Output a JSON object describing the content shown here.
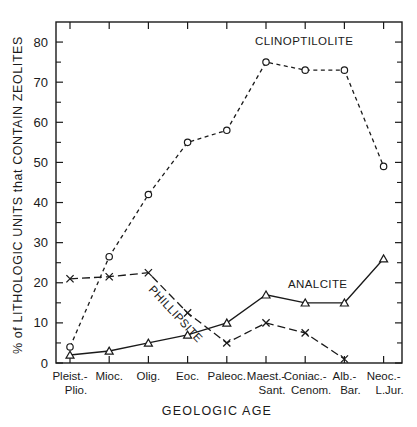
{
  "chart_data": {
    "type": "line",
    "title": "",
    "xlabel": "GEOLOGIC AGE",
    "ylabel": "% of LITHOLOGIC UNITS that CONTAIN ZEOLITES",
    "categories": [
      "Pleist.-\nPlio.",
      "Mioc.",
      "Olig.",
      "Eoc.",
      "Paleoc.",
      "Maest.-\nSant.",
      "Coniac.-\nCenom.",
      "Alb.-\nBar.",
      "Neoc.-\nL.Jur."
    ],
    "category_lines": [
      [
        "Pleist.-",
        "Plio."
      ],
      [
        "Mioc.",
        ""
      ],
      [
        "Olig.",
        ""
      ],
      [
        "Eoc.",
        ""
      ],
      [
        "Paleoc.",
        ""
      ],
      [
        "Maest.-",
        "Sant."
      ],
      [
        "Coniac.-",
        "Cenom."
      ],
      [
        "Alb.-",
        "Bar."
      ],
      [
        "Neoc.-",
        "L.Jur."
      ]
    ],
    "ylim": [
      0,
      85
    ],
    "yticks": [
      0,
      10,
      20,
      30,
      40,
      50,
      60,
      70,
      80
    ],
    "ytick_labels": [
      "0",
      "10",
      "20",
      "30",
      "40",
      "50",
      "60",
      "70",
      "80"
    ],
    "yminor_step": 5,
    "grid": false,
    "legend_position": "inline-annotations",
    "series": [
      {
        "name": "CLINOPTILOLITE",
        "marker": "circle",
        "linestyle": "dashed",
        "values": [
          4,
          26.5,
          42,
          55,
          58,
          75,
          73,
          73,
          49
        ]
      },
      {
        "name": "PHILLIPSITE",
        "marker": "x",
        "linestyle": "dash-long",
        "values": [
          21,
          21.5,
          22.5,
          12.5,
          5,
          10,
          7.5,
          1,
          null
        ]
      },
      {
        "name": "ANALCITE",
        "marker": "triangle",
        "linestyle": "solid",
        "values": [
          2,
          3,
          5,
          7,
          10,
          17,
          15,
          15,
          26
        ]
      }
    ],
    "annotations": [
      {
        "text": "CLINOPTILOLITE",
        "x": 255,
        "y": 45,
        "rotate": 0
      },
      {
        "text": "PHILLIPSITE",
        "x": 148,
        "y": 290,
        "rotate": 47
      },
      {
        "text": "ANALCITE",
        "x": 288,
        "y": 288,
        "rotate": 0
      }
    ]
  },
  "figure": {
    "y_axis_caption": "% of LITHOLOGIC UNITS that CONTAIN ZEOLITES",
    "x_axis_caption": "GEOLOGIC AGE"
  }
}
